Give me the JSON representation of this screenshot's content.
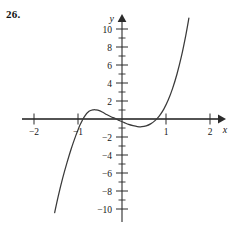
{
  "figure": {
    "problem_number": "26.",
    "background_color": "#ffffff",
    "curve_color": "#3a3a3a",
    "axis_color": "#2b2b2b",
    "axis_highlight_color": "#7d7d7d"
  },
  "chart_data": {
    "type": "line",
    "title": "",
    "subtitle": "",
    "xlabel": "x",
    "ylabel": "y",
    "xlim": [
      -2.35,
      2.35
    ],
    "ylim": [
      -11.5,
      11.8
    ],
    "grid": false,
    "legend": null,
    "x_ticks_major": [
      -2,
      -1,
      1,
      2
    ],
    "x_tick_labels": [
      "−2",
      "−1",
      "1",
      "2"
    ],
    "y_ticks_major": [
      -10,
      -8,
      -6,
      -4,
      -2,
      2,
      4,
      6,
      8,
      10
    ],
    "y_tick_labels": [
      "−10",
      "−8",
      "−6",
      "−4",
      "−2",
      "2",
      "4",
      "6",
      "8",
      "10"
    ],
    "y_minor_tick_step": 1,
    "roots": [
      -1.0,
      0.15,
      0.85
    ],
    "local_maximum": {
      "x": -0.6,
      "y": 1.0
    },
    "local_minimum": {
      "x": 0.45,
      "y": -0.85
    },
    "series": [
      {
        "name": "cubic",
        "x": [
          -1.53,
          -1.45,
          -1.35,
          -1.25,
          -1.15,
          -1.05,
          -1.0,
          -0.95,
          -0.85,
          -0.75,
          -0.65,
          -0.6,
          -0.55,
          -0.45,
          -0.35,
          -0.25,
          -0.15,
          -0.05,
          0.05,
          0.15,
          0.25,
          0.35,
          0.45,
          0.55,
          0.65,
          0.75,
          0.85,
          0.95,
          1.05,
          1.15,
          1.25,
          1.35,
          1.45,
          1.52
        ],
        "y": [
          -10.4,
          -8.6,
          -6.6,
          -4.85,
          -3.25,
          -1.85,
          -1.22,
          -0.62,
          0.3,
          0.85,
          1.02,
          1.02,
          0.98,
          0.78,
          0.5,
          0.25,
          0.05,
          -0.2,
          -0.4,
          -0.6,
          -0.74,
          -0.84,
          -0.86,
          -0.76,
          -0.54,
          -0.18,
          0.35,
          1.1,
          2.1,
          3.4,
          5.0,
          6.95,
          9.3,
          11.2
        ]
      }
    ]
  }
}
